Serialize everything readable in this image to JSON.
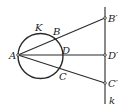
{
  "diagram": {
    "type": "geometry-inversion",
    "stroke_color": "#2a2a2a",
    "points": {
      "A": {
        "label": "A",
        "x": 18,
        "y": 55
      },
      "B": {
        "label": "B",
        "x": 55,
        "y": 38
      },
      "D": {
        "label": "D",
        "x": 63,
        "y": 55
      },
      "C": {
        "label": "C",
        "x": 59,
        "y": 72
      },
      "K": {
        "label": "K"
      },
      "B_prime": {
        "label": "B′",
        "x": 105,
        "y": 18
      },
      "D_prime": {
        "label": "D′",
        "x": 105,
        "y": 55
      },
      "C_prime": {
        "label": "C′",
        "x": 105,
        "y": 83
      }
    },
    "circle": {
      "name": "K",
      "cx": 40.5,
      "cy": 56,
      "r": 22.5
    },
    "line": {
      "name": "k",
      "label": "k",
      "x": 105,
      "y1": 7,
      "y2": 104
    }
  }
}
